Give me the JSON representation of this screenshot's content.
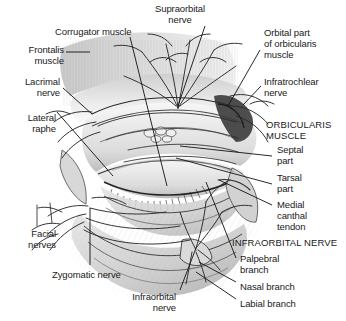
{
  "figure": {
    "background_color": "#ffffff",
    "ink_color": "#1a1a1a",
    "style": "pen-and-ink / pencil shaded medical illustration"
  },
  "labels": [
    {
      "id": "supraorbital-nerve",
      "text": "Supraorbital\nnerve",
      "x": 180,
      "y": 3,
      "align": "center",
      "caps": false
    },
    {
      "id": "corrugator-muscle",
      "text": "Corrugator muscle",
      "x": 55,
      "y": 26,
      "align": "left",
      "caps": false
    },
    {
      "id": "orbital-part",
      "text": "Orbital part\nof orbicularis\nmuscle",
      "x": 264,
      "y": 27,
      "align": "left",
      "caps": false
    },
    {
      "id": "frontalis-muscle",
      "text": "Frontalis\nmuscle",
      "x": 16,
      "y": 44,
      "align": "right",
      "caps": false
    },
    {
      "id": "infratrochlear-nerve",
      "text": "Infratrochlear\nnerve",
      "x": 264,
      "y": 76,
      "align": "left",
      "caps": false
    },
    {
      "id": "lacrimal-nerve",
      "text": "Lacrimal\nnerve",
      "x": 16,
      "y": 76,
      "align": "right",
      "caps": false
    },
    {
      "id": "orbicularis-muscle",
      "text": "ORBICULARIS\nMUSCLE",
      "x": 266,
      "y": 119,
      "align": "left",
      "caps": true
    },
    {
      "id": "lateral-raphe",
      "text": "Lateral\nraphe",
      "x": 12,
      "y": 112,
      "align": "right",
      "caps": false
    },
    {
      "id": "septal-part",
      "text": "Septal\npart",
      "x": 277,
      "y": 144,
      "align": "left",
      "caps": false
    },
    {
      "id": "tarsal-part",
      "text": "Tarsal\npart",
      "x": 277,
      "y": 172,
      "align": "left",
      "caps": false
    },
    {
      "id": "medial-canthal-tendon",
      "text": "Medial\ncanthal\ntendon",
      "x": 277,
      "y": 199,
      "align": "left",
      "caps": false
    },
    {
      "id": "facial-nerves",
      "text": "Facial\nnerves",
      "x": 12,
      "y": 228,
      "align": "right",
      "caps": false
    },
    {
      "id": "infraorbital-nerve-hdr",
      "text": "INFRAORBITAL NERVE",
      "x": 232,
      "y": 237,
      "align": "left",
      "caps": true
    },
    {
      "id": "palpebral-branch",
      "text": "Palpebral\nbranch",
      "x": 240,
      "y": 253,
      "align": "left",
      "caps": false
    },
    {
      "id": "zygomatic-nerve",
      "text": "Zygomatic nerve",
      "x": 52,
      "y": 269,
      "align": "left",
      "caps": false
    },
    {
      "id": "nasal-branch",
      "text": "Nasal branch",
      "x": 240,
      "y": 281,
      "align": "left",
      "caps": false
    },
    {
      "id": "labial-branch",
      "text": "Labial branch",
      "x": 240,
      "y": 298,
      "align": "left",
      "caps": false
    },
    {
      "id": "infraorbital-nerve",
      "text": "Infraorbital\nnerve",
      "x": 176,
      "y": 291,
      "align": "right",
      "caps": false
    }
  ],
  "leader_lines": [
    {
      "id": "supraorbital-nerve-leader",
      "x1": 205,
      "y1": 26,
      "x2": 178,
      "y2": 106
    },
    {
      "id": "corrugator-muscle-leader",
      "x1": 130,
      "y1": 37,
      "x2": 167,
      "y2": 186
    },
    {
      "id": "orbital-part-leader",
      "x1": 260,
      "y1": 50,
      "x2": 228,
      "y2": 106
    },
    {
      "id": "frontalis-muscle-leader",
      "x1": 66,
      "y1": 52,
      "x2": 90,
      "y2": 52
    },
    {
      "id": "lacrimal-nerve-leader",
      "x1": 63,
      "y1": 88,
      "x2": 90,
      "y2": 113
    },
    {
      "id": "infratrochlear-nerve-leader",
      "x1": 261,
      "y1": 86,
      "x2": 243,
      "y2": 105
    },
    {
      "id": "lateral-raphe-leader",
      "x1": 57,
      "y1": 112,
      "x2": 113,
      "y2": 176
    },
    {
      "id": "septal-part-leader",
      "x1": 272,
      "y1": 156,
      "x2": 180,
      "y2": 146
    },
    {
      "id": "tarsal-part-leader",
      "x1": 272,
      "y1": 184,
      "x2": 176,
      "y2": 158
    },
    {
      "id": "medial-canthal-leader",
      "x1": 272,
      "y1": 205,
      "x2": 219,
      "y2": 180
    },
    {
      "id": "palpebral-branch-leader",
      "x1": 236,
      "y1": 258,
      "x2": 206,
      "y2": 182
    },
    {
      "id": "nasal-branch-leader",
      "x1": 236,
      "y1": 282,
      "x2": 199,
      "y2": 262
    },
    {
      "id": "labial-branch-leader",
      "x1": 236,
      "y1": 299,
      "x2": 196,
      "y2": 272
    },
    {
      "id": "zygomatic-nerve-leader",
      "x1": 90,
      "y1": 265,
      "x2": 90,
      "y2": 208
    },
    {
      "id": "infraorbital-nerve-leader",
      "x1": 180,
      "y1": 290,
      "x2": 196,
      "y2": 248
    },
    {
      "id": "facial-nerves-leader-a",
      "x1": 37,
      "y1": 225,
      "x2": 37,
      "y2": 205
    },
    {
      "id": "facial-nerves-leader-b",
      "x1": 50,
      "y1": 222,
      "x2": 52,
      "y2": 204
    }
  ]
}
